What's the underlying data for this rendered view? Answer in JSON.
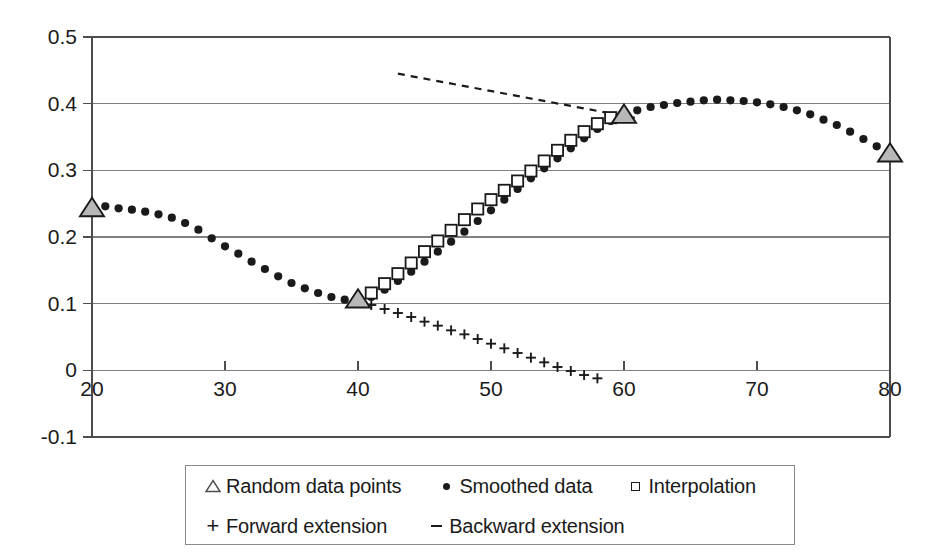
{
  "chart_data": {
    "type": "scatter",
    "title": "",
    "subtitle": "",
    "xlabel": "",
    "ylabel": "",
    "xlim": [
      20,
      80
    ],
    "ylim": [
      -0.1,
      0.5
    ],
    "xticks": [
      20,
      30,
      40,
      50,
      60,
      70,
      80
    ],
    "yticks": [
      -0.1,
      0,
      0.1,
      0.2,
      0.3,
      0.4,
      0.5
    ],
    "xtick_labels": [
      "20",
      "30",
      "40",
      "50",
      "60",
      "70",
      "80"
    ],
    "ytick_labels": [
      "-0.1",
      "0",
      "0.1",
      "0.2",
      "0.3",
      "0.4",
      "0.5"
    ],
    "grid": "horizontal",
    "legend_position": "below-plot",
    "series": [
      {
        "name": "Random data points",
        "marker": "triangle",
        "marker_fill": "#b8b8b8",
        "marker_edge": "#1a1a1a",
        "x": [
          20,
          40,
          60,
          80
        ],
        "y": [
          0.243,
          0.106,
          0.383,
          0.325
        ]
      },
      {
        "name": "Smoothed data",
        "marker": "dot",
        "marker_fill": "#1a1a1a",
        "marker_edge": "#1a1a1a",
        "x": [
          20,
          21,
          22,
          23,
          24,
          25,
          26,
          27,
          28,
          29,
          30,
          31,
          32,
          33,
          34,
          35,
          36,
          37,
          38,
          39,
          40,
          41,
          42,
          43,
          44,
          45,
          46,
          47,
          48,
          49,
          50,
          51,
          52,
          53,
          54,
          55,
          56,
          57,
          58,
          59,
          60,
          61,
          62,
          63,
          64,
          65,
          66,
          67,
          68,
          69,
          70,
          71,
          72,
          73,
          74,
          75,
          76,
          77,
          78,
          79,
          80
        ],
        "y": [
          0.24,
          0.246,
          0.243,
          0.241,
          0.238,
          0.234,
          0.229,
          0.221,
          0.211,
          0.198,
          0.186,
          0.175,
          0.163,
          0.152,
          0.141,
          0.131,
          0.123,
          0.116,
          0.11,
          0.106,
          0.105,
          0.11,
          0.121,
          0.134,
          0.148,
          0.163,
          0.178,
          0.193,
          0.208,
          0.224,
          0.24,
          0.256,
          0.272,
          0.288,
          0.303,
          0.318,
          0.333,
          0.348,
          0.362,
          0.374,
          0.383,
          0.39,
          0.395,
          0.398,
          0.401,
          0.403,
          0.405,
          0.406,
          0.405,
          0.404,
          0.402,
          0.399,
          0.395,
          0.39,
          0.384,
          0.376,
          0.368,
          0.358,
          0.347,
          0.336,
          0.325
        ]
      },
      {
        "name": "Interpolation",
        "marker": "square",
        "marker_fill": "#ffffff",
        "marker_edge": "#1a1a1a",
        "x": [
          41,
          42,
          43,
          44,
          45,
          46,
          47,
          48,
          49,
          50,
          51,
          52,
          53,
          54,
          55,
          56,
          57,
          58,
          59
        ],
        "y": [
          0.116,
          0.13,
          0.145,
          0.161,
          0.178,
          0.194,
          0.21,
          0.226,
          0.242,
          0.256,
          0.27,
          0.284,
          0.299,
          0.314,
          0.33,
          0.345,
          0.358,
          0.37,
          0.379
        ]
      },
      {
        "name": "Forward extension",
        "marker": "plus",
        "marker_fill": "#1a1a1a",
        "marker_edge": "#1a1a1a",
        "x": [
          41,
          42,
          43,
          44,
          45,
          46,
          47,
          48,
          49,
          50,
          51,
          52,
          53,
          54,
          55,
          56,
          57,
          58
        ],
        "y": [
          0.098,
          0.092,
          0.086,
          0.08,
          0.073,
          0.067,
          0.06,
          0.054,
          0.047,
          0.04,
          0.033,
          0.026,
          0.019,
          0.012,
          0.005,
          -0.001,
          -0.007,
          -0.012
        ]
      },
      {
        "name": "Backward extension",
        "marker": "dash-line",
        "marker_fill": "#1a1a1a",
        "marker_edge": "#1a1a1a",
        "linestyle": "dashed",
        "x": [
          43.0,
          61.0
        ],
        "y": [
          0.445,
          0.378
        ]
      }
    ]
  },
  "legend": {
    "rows": [
      [
        {
          "marker": "triangle-icon",
          "label": "Random data points"
        },
        {
          "marker": "dot-icon",
          "label": "Smoothed data"
        },
        {
          "marker": "square-icon",
          "label": "Interpolation"
        }
      ],
      [
        {
          "marker": "plus-icon",
          "label": "Forward extension"
        },
        {
          "marker": "dash-icon",
          "label": "Backward extension"
        }
      ]
    ]
  },
  "colors": {
    "axis": "#4d4d4d",
    "grid": "#808080",
    "marker_dark": "#1a1a1a",
    "triangle_fill": "#b8b8b8",
    "legend_border": "#8a8a8a",
    "background": "#ffffff"
  }
}
